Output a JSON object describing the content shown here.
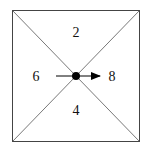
{
  "diagram": {
    "type": "square-with-diagonals",
    "regions": [
      {
        "position": "top",
        "label": "2"
      },
      {
        "position": "left",
        "label": "6"
      },
      {
        "position": "right",
        "label": "8"
      },
      {
        "position": "bottom",
        "label": "4"
      }
    ],
    "center_marker": {
      "type": "dot",
      "color": "#000000"
    },
    "arrow": {
      "direction": "right",
      "color": "#000000"
    },
    "line_color": "#444444"
  }
}
